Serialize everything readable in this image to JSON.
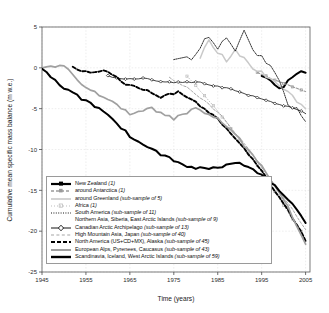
{
  "chart_data": {
    "type": "line",
    "title": "",
    "xlabel": "Time (years)",
    "ylabel": "Cumulative mean specific mass balance (m w.e.)",
    "xlim": [
      1945,
      2006
    ],
    "ylim": [
      -25,
      5
    ],
    "xticks": [
      1945,
      1955,
      1965,
      1975,
      1985,
      1995,
      2005
    ],
    "yticks": [
      5,
      0,
      -5,
      -10,
      -15,
      -20,
      -25
    ],
    "xtick_labels": [
      "1945",
      "1955",
      "1965",
      "1975",
      "1985",
      "1995",
      "2005"
    ],
    "ytick_labels": [
      "5",
      "0",
      "-5",
      "-10",
      "-15",
      "-20",
      "-25"
    ],
    "grid": true,
    "legend_position": "lower-left",
    "series": [
      {
        "name": "New Zealand",
        "sample": "(1)",
        "key": "thick-black-dot-line",
        "color": "#000000",
        "x": [
          1995,
          1996,
          1997,
          1998,
          1999,
          2000,
          2001,
          2002,
          2003,
          2004,
          2005
        ],
        "y": [
          -1.0,
          -1.2,
          -1.5,
          -2.0,
          -2.4,
          -2.2,
          -1.6,
          -1.1,
          -0.7,
          -0.5,
          -0.6
        ]
      },
      {
        "name": "around Antarctica",
        "sample": "(1)",
        "key": "gray-dashed-square",
        "color": "#9a9a9a",
        "x": [
          1994,
          1995,
          1996,
          1997,
          1998,
          1999,
          2000,
          2001,
          2002,
          2003,
          2004,
          2005
        ],
        "y": [
          -0.6,
          -0.8,
          -1.0,
          -1.3,
          -1.5,
          -1.7,
          -1.9,
          -2.1,
          -2.3,
          -2.5,
          -2.7,
          -2.9
        ]
      },
      {
        "name": "around Greenland",
        "sample": "(sub-sample of 5)",
        "key": "light-gray-solid",
        "color": "#c9c9c9",
        "x": [
          1981,
          1983,
          1985,
          1987,
          1989,
          1991,
          1993,
          1995,
          1997,
          1999,
          2001,
          2003,
          2005
        ],
        "y": [
          1.0,
          3.5,
          1.8,
          1.0,
          2.0,
          1.2,
          0.0,
          -0.6,
          -1.2,
          -2.0,
          -3.0,
          -4.0,
          -5.0
        ]
      },
      {
        "name": "Africa",
        "sample": "(1)",
        "key": "light-gray-dotted-square",
        "color": "#bdbdbd",
        "x": [
          1978,
          1980,
          1982,
          1984,
          1986,
          1988,
          1990,
          1992,
          1994,
          1996,
          1998,
          2000,
          2002,
          2004
        ],
        "y": [
          -1.0,
          -2.2,
          -3.4,
          -4.6,
          -6.0,
          -7.4,
          -8.8,
          -10.4,
          -12.0,
          -13.6,
          -15.2,
          -16.8,
          -18.5,
          -20.0
        ]
      },
      {
        "name": "South America",
        "sample": "(sub-sample of 11)",
        "key": "black-dotted-fine",
        "color": "#161616",
        "x": [
          1975,
          1977,
          1979,
          1981,
          1983,
          1985,
          1987,
          1989,
          1991,
          1993,
          1995,
          1997,
          1999,
          2001,
          2003,
          2005
        ],
        "y": [
          1.2,
          1.3,
          1.2,
          2.6,
          4.0,
          2.2,
          3.9,
          2.0,
          4.4,
          2.0,
          1.4,
          0.2,
          -1.6,
          -4.6,
          -5.0,
          -6.6
        ]
      },
      {
        "name": "Northern Asia, Siberia, East Arctic Islands",
        "sample": "(sub-sample of 9)",
        "key": "blank",
        "color": "#7f7f7f",
        "x": [
          1945,
          1950,
          1955,
          1960,
          1965,
          1970,
          1975,
          1980,
          1985,
          1990,
          1995,
          2000,
          2005
        ],
        "y": [
          0.0,
          1.0,
          -1.3,
          -2.6,
          -3.3,
          -4.6,
          -4.5,
          -5.4,
          -5.3,
          -6.4,
          -8.4,
          -10.6,
          -12.0
        ]
      },
      {
        "name": "Canadian Arctic Archipelago",
        "sample": "(sub-sample of 13)",
        "key": "black-open-diamond-line",
        "color": "#141414",
        "x": [
          1960,
          1964,
          1968,
          1972,
          1976,
          1980,
          1984,
          1988,
          1992,
          1996,
          2000,
          2004,
          2005
        ],
        "y": [
          -1.0,
          -1.4,
          -1.3,
          -1.6,
          -1.8,
          -1.7,
          -2.2,
          -2.6,
          -3.3,
          -4.0,
          -4.6,
          -5.2,
          -5.6
        ]
      },
      {
        "name": "High Mountain Asia, Japan",
        "sample": "(sub-sample of 40)",
        "key": "gray-dashed-fine",
        "color": "#a6a6a6",
        "x": [
          1974,
          1978,
          1982,
          1986,
          1990,
          1994,
          1998,
          2002,
          2005
        ],
        "y": [
          -1.2,
          -2.4,
          -4.0,
          -6.0,
          -8.6,
          -11.4,
          -14.4,
          -17.4,
          -19.8
        ]
      },
      {
        "name": "North America (US+CD+MX), Alaska",
        "sample": "(sub-sample of 45)",
        "key": "black-thick-dashed",
        "color": "#000000",
        "x": [
          1952,
          1956,
          1960,
          1964,
          1968,
          1972,
          1976,
          1980,
          1984,
          1988,
          1992,
          1996,
          2000,
          2004,
          2005
        ],
        "y": [
          0.0,
          -0.6,
          -0.4,
          -2.0,
          -2.6,
          -3.6,
          -3.0,
          -4.2,
          -5.8,
          -8.0,
          -10.6,
          -13.4,
          -16.6,
          -20.0,
          -21.2
        ]
      },
      {
        "name": "European Alps, Pyrenees, Caucasus",
        "sample": "(sub-sample of 43)",
        "key": "gray-thick-solid",
        "color": "#a0a0a0",
        "x": [
          1945,
          1950,
          1955,
          1960,
          1965,
          1970,
          1975,
          1980,
          1985,
          1990,
          1995,
          2000,
          2005
        ],
        "y": [
          0.0,
          0.2,
          -2.4,
          -3.8,
          -5.6,
          -5.0,
          -6.2,
          -5.0,
          -6.2,
          -8.8,
          -12.0,
          -16.0,
          -21.6
        ]
      },
      {
        "name": "Scandinavia, Iceland, West Arctic Islands",
        "sample": "(sub-sample of 59)",
        "key": "black-thick-solid",
        "color": "#000000",
        "x": [
          1945,
          1950,
          1955,
          1960,
          1965,
          1970,
          1975,
          1980,
          1985,
          1990,
          1995,
          2000,
          2005
        ],
        "y": [
          0.0,
          -2.6,
          -4.0,
          -5.6,
          -8.4,
          -10.0,
          -11.4,
          -12.4,
          -12.2,
          -11.6,
          -13.2,
          -15.4,
          -19.0
        ]
      }
    ]
  }
}
